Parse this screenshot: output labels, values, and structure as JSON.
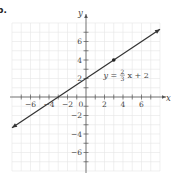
{
  "part_label": "b.",
  "chart_data": {
    "type": "line",
    "title": "",
    "xlabel": "x",
    "ylabel": "y",
    "xlim": [
      -8,
      8
    ],
    "ylim": [
      -8,
      8
    ],
    "grid": true,
    "x_ticks": [
      -6,
      -4,
      -2,
      0,
      2,
      4,
      6
    ],
    "y_ticks": [
      -6,
      -4,
      -2,
      2,
      4,
      6
    ],
    "origin_label": "0",
    "series": [
      {
        "name": "y = (2/3)x + 2",
        "equation": "y = 2/3 x + 2",
        "slope": 0.6667,
        "intercept": 2,
        "x": [
          -8,
          8
        ],
        "y": [
          -3.33,
          7.33
        ],
        "arrows": "both",
        "color": "#333333"
      }
    ],
    "points": [
      {
        "x": 3,
        "y": 4,
        "marker": "filled-circle"
      }
    ],
    "annotations": [
      {
        "text": "y = 2/3 x + 2",
        "x": 3.5,
        "y": 2.3,
        "numerator": "2",
        "denominator": "3",
        "prefix": "y =",
        "suffix": "x + 2"
      }
    ]
  }
}
